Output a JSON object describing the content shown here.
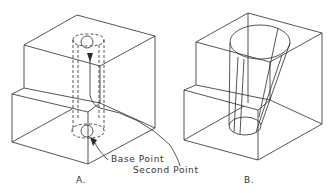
{
  "figure": {
    "panels": [
      {
        "id": "A",
        "caption": "A.",
        "description": "Stepped block with dashed cylindrical hole and path arrow"
      },
      {
        "id": "B",
        "caption": "B.",
        "description": "Stepped block with tapered conical hole"
      }
    ],
    "annotations": {
      "base_point": "Base Point",
      "second_point": "Second Point"
    },
    "colors": {
      "line": "#2a2a2a",
      "background": "#ffffff",
      "text": "#333333"
    }
  }
}
